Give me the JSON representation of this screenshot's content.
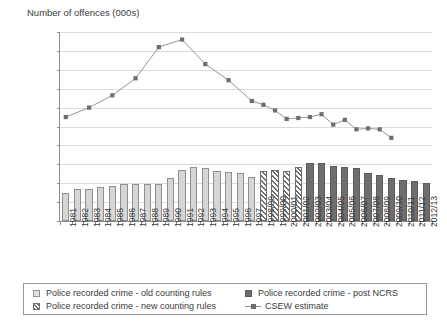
{
  "chart_data": {
    "type": "bar",
    "title": "Number of offences (000s)",
    "xlabel": "",
    "ylabel": "Number of offences (000s)",
    "ylim": [
      0,
      20000
    ],
    "ytick_values": [
      0,
      2000,
      4000,
      6000,
      8000,
      10000,
      12000,
      14000,
      16000,
      18000,
      20000
    ],
    "ytick_labels": [
      "0",
      "2,000",
      "4,000",
      "6,000",
      "8,000",
      "10,000",
      "12,000",
      "14,000",
      "16,000",
      "18,000",
      "20,000"
    ],
    "grid": true,
    "legend_position": "bottom",
    "categories": [
      "1981",
      "1982",
      "1983",
      "1984",
      "1985",
      "1986",
      "1987",
      "1988",
      "1989",
      "1990",
      "1991",
      "1992",
      "1993",
      "1994",
      "1995",
      "1996",
      "1997",
      "1998/99",
      "1999/00",
      "2000/01",
      "2001/02",
      "2002/03",
      "2003/04",
      "2004/05",
      "2005/06",
      "2006/07",
      "2007/08",
      "2008/09",
      "2009/10",
      "2010/11",
      "2011/12",
      "2012/13"
    ],
    "series": [
      {
        "name": "Police recorded crime - old counting rules",
        "type": "bar",
        "style": "light-grey-fill",
        "color": "#d6d6d6",
        "values": [
          3000,
          3350,
          3400,
          3550,
          3670,
          3900,
          3900,
          3900,
          3900,
          4560,
          5370,
          5720,
          5600,
          5320,
          5180,
          5100,
          4650,
          4620,
          null,
          null,
          null,
          null,
          null,
          null,
          null,
          null,
          null,
          null,
          null,
          null,
          null,
          null
        ]
      },
      {
        "name": "Police recorded crime - new counting rules",
        "type": "bar",
        "style": "diagonal-hatch",
        "color": "#6e6e6e",
        "values": [
          null,
          null,
          null,
          null,
          null,
          null,
          null,
          null,
          null,
          null,
          null,
          null,
          null,
          null,
          null,
          null,
          null,
          5320,
          5420,
          5320,
          5670,
          null,
          null,
          null,
          null,
          null,
          null,
          null,
          null,
          null,
          null,
          null
        ]
      },
      {
        "name": "Police recorded crime - post NCRS",
        "type": "bar",
        "style": "dark-grey-fill",
        "color": "#6e6e6e",
        "values": [
          null,
          null,
          null,
          null,
          null,
          null,
          null,
          null,
          null,
          null,
          null,
          null,
          null,
          null,
          null,
          null,
          null,
          null,
          null,
          null,
          null,
          6110,
          6090,
          5790,
          5740,
          5600,
          5100,
          4850,
          4600,
          4340,
          4250,
          4020
        ]
      },
      {
        "name": "CSEW estimate",
        "type": "line",
        "color": "#8a8a8a",
        "marker": "square",
        "values": [
          11000,
          null,
          12000,
          null,
          13300,
          null,
          15100,
          null,
          18400,
          null,
          19200,
          null,
          16600,
          null,
          14900,
          null,
          12700,
          12300,
          11700,
          10800,
          10900,
          11000,
          11300,
          10200,
          10700,
          9700,
          9800,
          9700,
          8800,
          null,
          null,
          null
        ],
        "values_by_category": {
          "1981": 11000,
          "1983": 12000,
          "1985": 13300,
          "1987": 15100,
          "1989": 18400,
          "1991": 19200,
          "1993": 16600,
          "1995": 14900,
          "1997": 12700,
          "1998/99": 12300,
          "1999/00": 11700,
          "2000/01": 10800,
          "2001/02": 10900,
          "2002/03": 11000,
          "2003/04": 11300,
          "2004/05": 10200,
          "2005/06": 10700,
          "2006/07": 9700,
          "2007/08": 9800,
          "2008/09": 9700,
          "2009/10": 8800
        }
      }
    ]
  },
  "legend": {
    "items": [
      {
        "label": "Police recorded crime - old counting rules",
        "marker": "light-square"
      },
      {
        "label": "Police recorded crime - new counting rules",
        "marker": "hatched-square"
      },
      {
        "label": "Police recorded crime - post NCRS",
        "marker": "dark-square"
      },
      {
        "label": "CSEW estimate",
        "marker": "line-square"
      }
    ]
  },
  "colors": {
    "old_bar": "#d6d6d6",
    "new_bar_hatch": "#6e6e6e",
    "ncrs_bar": "#6e6e6e",
    "line": "#8a8a8a",
    "axis": "#8d8d8d",
    "grid": "#dcdcdc",
    "text": "#3b3b3b"
  }
}
